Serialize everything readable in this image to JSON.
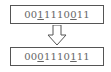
{
  "diagram": {
    "type": "bit-swap-mutation",
    "before": {
      "bits": [
        "0",
        "0",
        "1",
        "1",
        "1",
        "1",
        "0",
        "0",
        "1",
        "1"
      ],
      "text": "0011110011",
      "underlined_positions": [
        2,
        7
      ]
    },
    "after": {
      "bits": [
        "0",
        "0",
        "0",
        "1",
        "1",
        "1",
        "0",
        "1",
        "1",
        "1"
      ],
      "text": "0001110111",
      "underlined_positions": [
        2,
        7
      ]
    },
    "arrow": "down-arrow",
    "colors": {
      "border": "#555555",
      "text": "#666666",
      "background": "#ffffff"
    }
  }
}
